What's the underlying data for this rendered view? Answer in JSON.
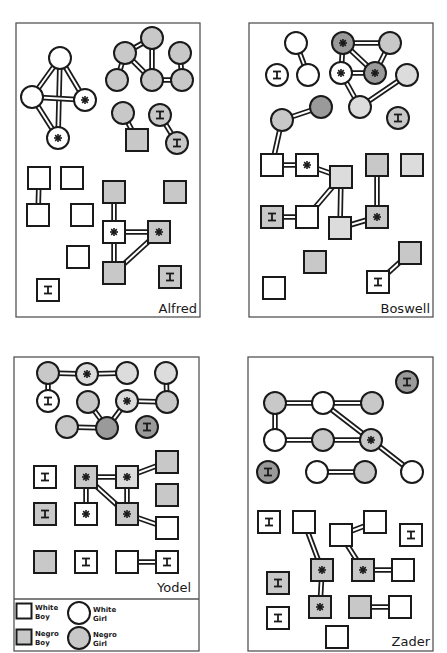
{
  "figure": {
    "colors": {
      "background": "#ffffff",
      "panel_border": "#555555",
      "node_stroke": "#1a1a1a",
      "white_fill": "#ffffff",
      "negro_fill": "#c8c8c8",
      "negro_dark_fill": "#9a9a9a",
      "negro_pale_fill": "#dcdcdc"
    },
    "node_types": {
      "wb": "White Boy",
      "wg": "White Girl",
      "nb": "Negro Boy",
      "ng": "Negro Girl"
    },
    "markers": {
      "star": "star (mutual choice marker)",
      "I": "isolate"
    }
  },
  "legend": {
    "items": [
      {
        "type": "wb",
        "line1": "White",
        "line2": "Boy",
        "x": 24,
        "y": 611
      },
      {
        "type": "wg",
        "line1": "White",
        "line2": "Girl",
        "x": 79,
        "y": 613
      },
      {
        "type": "nb",
        "line1": "Negro",
        "line2": "Boy",
        "x": 24,
        "y": 637
      },
      {
        "type": "ng",
        "line1": "Negro",
        "line2": "Girl",
        "x": 79,
        "y": 638
      }
    ]
  },
  "panels": [
    {
      "name": "Alfred",
      "box": [
        16,
        23,
        184,
        294
      ],
      "label_pos": [
        197,
        313
      ],
      "nodes": [
        {
          "id": "a1",
          "type": "wg",
          "x": 60,
          "y": 58
        },
        {
          "id": "a2",
          "type": "wg",
          "x": 32,
          "y": 97
        },
        {
          "id": "a3",
          "type": "wg",
          "x": 85,
          "y": 100,
          "mark": "star"
        },
        {
          "id": "a4",
          "type": "wg",
          "x": 58,
          "y": 138,
          "mark": "star"
        },
        {
          "id": "a5",
          "type": "ng",
          "x": 152,
          "y": 38
        },
        {
          "id": "a6",
          "type": "ng",
          "x": 125,
          "y": 53
        },
        {
          "id": "a7",
          "type": "ng",
          "x": 180,
          "y": 53
        },
        {
          "id": "a8",
          "type": "ng",
          "x": 117,
          "y": 80
        },
        {
          "id": "a9",
          "type": "ng",
          "x": 152,
          "y": 80
        },
        {
          "id": "a10",
          "type": "ng",
          "x": 182,
          "y": 80
        },
        {
          "id": "a11",
          "type": "ng",
          "x": 123,
          "y": 113
        },
        {
          "id": "a12",
          "type": "nb",
          "x": 137,
          "y": 140
        },
        {
          "id": "a13",
          "type": "ng",
          "x": 160,
          "y": 115,
          "mark": "I"
        },
        {
          "id": "a14",
          "type": "ng",
          "x": 177,
          "y": 143,
          "mark": "I"
        },
        {
          "id": "a15",
          "type": "wb",
          "x": 39,
          "y": 178
        },
        {
          "id": "a16",
          "type": "wb",
          "x": 38,
          "y": 215
        },
        {
          "id": "a17",
          "type": "wb",
          "x": 72,
          "y": 178
        },
        {
          "id": "a18",
          "type": "wb",
          "x": 82,
          "y": 215
        },
        {
          "id": "a19",
          "type": "wb",
          "x": 78,
          "y": 257
        },
        {
          "id": "a20",
          "type": "wb",
          "x": 48,
          "y": 290,
          "mark": "I"
        },
        {
          "id": "a21",
          "type": "nb",
          "x": 114,
          "y": 192
        },
        {
          "id": "a22",
          "type": "wb",
          "x": 114,
          "y": 232,
          "mark": "star"
        },
        {
          "id": "a23",
          "type": "nb",
          "x": 159,
          "y": 232,
          "mark": "star"
        },
        {
          "id": "a24",
          "type": "nb",
          "x": 114,
          "y": 273
        },
        {
          "id": "a25",
          "type": "nb",
          "x": 175,
          "y": 192
        },
        {
          "id": "a26",
          "type": "nb",
          "x": 170,
          "y": 277,
          "mark": "I"
        }
      ],
      "edges": [
        [
          "a1",
          "a2"
        ],
        [
          "a1",
          "a3"
        ],
        [
          "a1",
          "a4"
        ],
        [
          "a2",
          "a3"
        ],
        [
          "a2",
          "a4"
        ],
        [
          "a5",
          "a6"
        ],
        [
          "a5",
          "a9"
        ],
        [
          "a6",
          "a8"
        ],
        [
          "a6",
          "a9"
        ],
        [
          "a9",
          "a10"
        ],
        [
          "a7",
          "a10"
        ],
        [
          "a11",
          "a12"
        ],
        [
          "a13",
          "a14"
        ],
        [
          "a15",
          "a16"
        ],
        [
          "a21",
          "a22"
        ],
        [
          "a22",
          "a23"
        ],
        [
          "a22",
          "a24"
        ],
        [
          "a23",
          "a24"
        ]
      ]
    },
    {
      "name": "Boswell",
      "box": [
        249,
        23,
        184,
        294
      ],
      "label_pos": [
        430,
        313
      ],
      "nodes": [
        {
          "id": "b1",
          "type": "wg",
          "x": 296,
          "y": 43
        },
        {
          "id": "b2",
          "type": "wg",
          "x": 308,
          "y": 75
        },
        {
          "id": "b3",
          "type": "wg",
          "x": 277,
          "y": 75,
          "mark": "I"
        },
        {
          "id": "b4",
          "type": "ng",
          "x": 343,
          "y": 43,
          "mark": "star",
          "shade": "dark"
        },
        {
          "id": "b5",
          "type": "ng",
          "x": 390,
          "y": 43
        },
        {
          "id": "b6",
          "type": "wg",
          "x": 341,
          "y": 73,
          "mark": "star"
        },
        {
          "id": "b7",
          "type": "ng",
          "x": 375,
          "y": 73,
          "mark": "star",
          "shade": "dark"
        },
        {
          "id": "b8",
          "type": "ng",
          "x": 407,
          "y": 75,
          "shade": "pale"
        },
        {
          "id": "b9",
          "type": "ng",
          "x": 360,
          "y": 107,
          "shade": "pale"
        },
        {
          "id": "b10",
          "type": "ng",
          "x": 282,
          "y": 120
        },
        {
          "id": "b11",
          "type": "ng",
          "x": 321,
          "y": 107,
          "shade": "dark"
        },
        {
          "id": "b12",
          "type": "ng",
          "x": 398,
          "y": 118,
          "mark": "I"
        },
        {
          "id": "b13",
          "type": "wb",
          "x": 272,
          "y": 165
        },
        {
          "id": "b14",
          "type": "wb",
          "x": 307,
          "y": 165,
          "mark": "star"
        },
        {
          "id": "b15",
          "type": "nb",
          "x": 341,
          "y": 177,
          "shade": "pale"
        },
        {
          "id": "b16",
          "type": "nb",
          "x": 377,
          "y": 165
        },
        {
          "id": "b17",
          "type": "nb",
          "x": 412,
          "y": 165,
          "shade": "pale"
        },
        {
          "id": "b18",
          "type": "nb",
          "x": 272,
          "y": 217,
          "mark": "I"
        },
        {
          "id": "b19",
          "type": "wb",
          "x": 307,
          "y": 217
        },
        {
          "id": "b20",
          "type": "nb",
          "x": 340,
          "y": 228,
          "shade": "pale"
        },
        {
          "id": "b21",
          "type": "nb",
          "x": 377,
          "y": 217,
          "mark": "star"
        },
        {
          "id": "b22",
          "type": "nb",
          "x": 410,
          "y": 253
        },
        {
          "id": "b23",
          "type": "wb",
          "x": 378,
          "y": 282,
          "mark": "I"
        },
        {
          "id": "b24",
          "type": "nb",
          "x": 315,
          "y": 262
        },
        {
          "id": "b25",
          "type": "wb",
          "x": 274,
          "y": 288
        }
      ],
      "edges": [
        [
          "b1",
          "b2"
        ],
        [
          "b4",
          "b5"
        ],
        [
          "b4",
          "b6"
        ],
        [
          "b4",
          "b7"
        ],
        [
          "b6",
          "b7"
        ],
        [
          "b5",
          "b7"
        ],
        [
          "b6",
          "b9"
        ],
        [
          "b9",
          "b8"
        ],
        [
          "b10",
          "b11"
        ],
        [
          "b10",
          "b13"
        ],
        [
          "b13",
          "b14"
        ],
        [
          "b14",
          "b15"
        ],
        [
          "b15",
          "b19"
        ],
        [
          "b15",
          "b20"
        ],
        [
          "b18",
          "b19"
        ],
        [
          "b16",
          "b21"
        ],
        [
          "b20",
          "b21"
        ],
        [
          "b22",
          "b23"
        ]
      ]
    },
    {
      "name": "Yodel",
      "box": [
        14,
        357,
        185,
        294
      ],
      "label_pos": [
        191,
        592
      ],
      "legend_divider_y": 599,
      "nodes": [
        {
          "id": "y1",
          "type": "ng",
          "x": 48,
          "y": 373
        },
        {
          "id": "y2",
          "type": "ng",
          "x": 87,
          "y": 374,
          "mark": "star",
          "shade": "pale"
        },
        {
          "id": "y3",
          "type": "ng",
          "x": 127,
          "y": 373,
          "shade": "pale"
        },
        {
          "id": "y4",
          "type": "ng",
          "x": 166,
          "y": 373,
          "shade": "pale"
        },
        {
          "id": "y5",
          "type": "wg",
          "x": 48,
          "y": 401,
          "mark": "I"
        },
        {
          "id": "y6",
          "type": "ng",
          "x": 88,
          "y": 402
        },
        {
          "id": "y7",
          "type": "ng",
          "x": 127,
          "y": 401,
          "mark": "star",
          "shade": "pale"
        },
        {
          "id": "y8",
          "type": "ng",
          "x": 167,
          "y": 402
        },
        {
          "id": "y9",
          "type": "ng",
          "x": 67,
          "y": 427
        },
        {
          "id": "y10",
          "type": "ng",
          "x": 107,
          "y": 428,
          "shade": "dark"
        },
        {
          "id": "y11",
          "type": "ng",
          "x": 147,
          "y": 427,
          "mark": "I",
          "shade": "dark"
        },
        {
          "id": "y12",
          "type": "wb",
          "x": 45,
          "y": 477,
          "mark": "I"
        },
        {
          "id": "y13",
          "type": "nb",
          "x": 86,
          "y": 477,
          "mark": "star"
        },
        {
          "id": "y14",
          "type": "nb",
          "x": 127,
          "y": 477,
          "mark": "star",
          "shade": "pale"
        },
        {
          "id": "y15",
          "type": "nb",
          "x": 167,
          "y": 462
        },
        {
          "id": "y16",
          "type": "nb",
          "x": 45,
          "y": 514,
          "mark": "I"
        },
        {
          "id": "y17",
          "type": "wb",
          "x": 86,
          "y": 514,
          "mark": "star"
        },
        {
          "id": "y18",
          "type": "nb",
          "x": 127,
          "y": 514,
          "mark": "star"
        },
        {
          "id": "y19",
          "type": "nb",
          "x": 167,
          "y": 495
        },
        {
          "id": "y20",
          "type": "wb",
          "x": 167,
          "y": 528
        },
        {
          "id": "y21",
          "type": "nb",
          "x": 45,
          "y": 562
        },
        {
          "id": "y22",
          "type": "wb",
          "x": 86,
          "y": 562,
          "mark": "I"
        },
        {
          "id": "y23",
          "type": "wb",
          "x": 127,
          "y": 562
        },
        {
          "id": "y24",
          "type": "wb",
          "x": 167,
          "y": 562,
          "mark": "I"
        }
      ],
      "edges": [
        [
          "y1",
          "y2"
        ],
        [
          "y2",
          "y3"
        ],
        [
          "y1",
          "y5"
        ],
        [
          "y4",
          "y8"
        ],
        [
          "y7",
          "y8"
        ],
        [
          "y6",
          "y10"
        ],
        [
          "y7",
          "y10"
        ],
        [
          "y9",
          "y10"
        ],
        [
          "y13",
          "y14"
        ],
        [
          "y13",
          "y17"
        ],
        [
          "y13",
          "y18"
        ],
        [
          "y14",
          "y18"
        ],
        [
          "y14",
          "y15"
        ],
        [
          "y18",
          "y20"
        ],
        [
          "y23",
          "y24"
        ]
      ]
    },
    {
      "name": "Zader",
      "box": [
        248,
        357,
        185,
        294
      ],
      "label_pos": [
        430,
        646
      ],
      "nodes": [
        {
          "id": "z1",
          "type": "ng",
          "x": 407,
          "y": 382,
          "mark": "I",
          "shade": "dark"
        },
        {
          "id": "z2",
          "type": "ng",
          "x": 275,
          "y": 403
        },
        {
          "id": "z3",
          "type": "wg",
          "x": 323,
          "y": 403
        },
        {
          "id": "z4",
          "type": "ng",
          "x": 372,
          "y": 403
        },
        {
          "id": "z5",
          "type": "wg",
          "x": 275,
          "y": 440
        },
        {
          "id": "z6",
          "type": "ng",
          "x": 323,
          "y": 440
        },
        {
          "id": "z7",
          "type": "ng",
          "x": 371,
          "y": 440,
          "mark": "star"
        },
        {
          "id": "z8",
          "type": "ng",
          "x": 268,
          "y": 472,
          "mark": "I",
          "shade": "dark"
        },
        {
          "id": "z9",
          "type": "wg",
          "x": 317,
          "y": 472
        },
        {
          "id": "z10",
          "type": "ng",
          "x": 365,
          "y": 472
        },
        {
          "id": "z11",
          "type": "wg",
          "x": 412,
          "y": 472
        },
        {
          "id": "z12",
          "type": "wb",
          "x": 269,
          "y": 522,
          "mark": "I"
        },
        {
          "id": "z13",
          "type": "wb",
          "x": 304,
          "y": 522
        },
        {
          "id": "z14",
          "type": "wb",
          "x": 341,
          "y": 535
        },
        {
          "id": "z15",
          "type": "wb",
          "x": 375,
          "y": 522
        },
        {
          "id": "z16",
          "type": "wb",
          "x": 411,
          "y": 535,
          "mark": "I"
        },
        {
          "id": "z17",
          "type": "nb",
          "x": 322,
          "y": 570,
          "mark": "star"
        },
        {
          "id": "z18",
          "type": "nb",
          "x": 363,
          "y": 570,
          "mark": "star"
        },
        {
          "id": "z19",
          "type": "wb",
          "x": 403,
          "y": 570
        },
        {
          "id": "z20",
          "type": "nb",
          "x": 278,
          "y": 583,
          "mark": "I"
        },
        {
          "id": "z21",
          "type": "nb",
          "x": 320,
          "y": 607,
          "mark": "star"
        },
        {
          "id": "z22",
          "type": "nb",
          "x": 360,
          "y": 607
        },
        {
          "id": "z23",
          "type": "wb",
          "x": 400,
          "y": 607
        },
        {
          "id": "z24",
          "type": "wb",
          "x": 278,
          "y": 618,
          "mark": "I"
        },
        {
          "id": "z25",
          "type": "wb",
          "x": 337,
          "y": 637
        }
      ],
      "edges": [
        [
          "z2",
          "z3"
        ],
        [
          "z3",
          "z4"
        ],
        [
          "z2",
          "z5"
        ],
        [
          "z5",
          "z6"
        ],
        [
          "z6",
          "z7"
        ],
        [
          "z3",
          "z7"
        ],
        [
          "z7",
          "z11"
        ],
        [
          "z9",
          "z10"
        ],
        [
          "z13",
          "z17"
        ],
        [
          "z14",
          "z15"
        ],
        [
          "z14",
          "z18"
        ],
        [
          "z18",
          "z19"
        ],
        [
          "z17",
          "z21"
        ],
        [
          "z22",
          "z23"
        ]
      ]
    }
  ]
}
